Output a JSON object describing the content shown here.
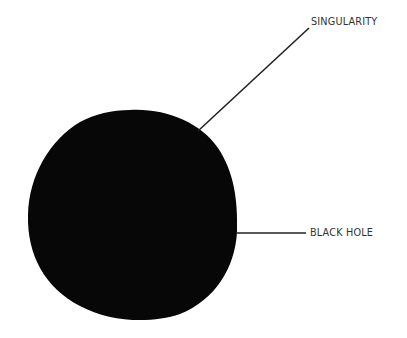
{
  "diagram": {
    "title": "",
    "colors": {
      "blob": "#070707",
      "line": "#222222",
      "text": "#333333",
      "background": "#ffffff"
    },
    "shape": {
      "name": "black-hole-blob",
      "bbox": [
        27,
        109,
        237,
        321
      ]
    },
    "labels": [
      {
        "id": "singularity",
        "text": "SINGULARITY",
        "x": 311,
        "y": 15,
        "line": [
          198,
          131,
          309,
          28
        ]
      },
      {
        "id": "black-hole",
        "text": "BLACK HOLE",
        "x": 310,
        "y": 226,
        "line": [
          236,
          233,
          306,
          233
        ]
      }
    ]
  }
}
